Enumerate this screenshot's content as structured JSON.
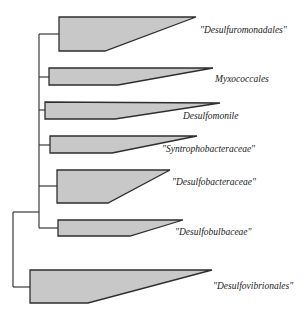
{
  "diagram": {
    "type": "phylogenetic-tree",
    "colors": {
      "clade_fill": "#c8c8c8",
      "line": "#2e2e2e",
      "background": "#ffffff"
    },
    "clades": [
      {
        "label": "\"Desulfuromonadales\"",
        "label_x": 200,
        "label_y": 25
      },
      {
        "label": "Myxococcales",
        "label_x": 215,
        "label_y": 74
      },
      {
        "label": "Desulfomonile",
        "label_x": 183,
        "label_y": 111
      },
      {
        "label": "\"Syntrophobacteraceae\"",
        "label_x": 162,
        "label_y": 144
      },
      {
        "label": "\"Desulfobacteraceae\"",
        "label_x": 172,
        "label_y": 177
      },
      {
        "label": "\"Desulfobulbaceae\"",
        "label_x": 175,
        "label_y": 227
      },
      {
        "label": "\"Desulfovibrionales\"",
        "label_x": 213,
        "label_y": 281
      }
    ]
  }
}
